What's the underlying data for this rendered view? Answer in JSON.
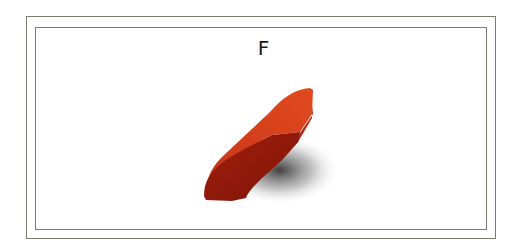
{
  "figure": {
    "label": "F",
    "object": {
      "description": "3D red extruded profile piece with curved front face",
      "colors": {
        "top_face": "#d8401a",
        "front_face": "#9a1a0a",
        "side_face": "#b52a12",
        "shadow": "#3a3a3a",
        "border": "#7a7a72"
      }
    }
  }
}
